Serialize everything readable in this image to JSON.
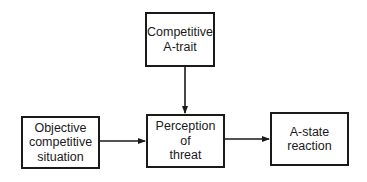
{
  "diagram": {
    "type": "flowchart",
    "nodes": [
      {
        "id": "trait",
        "label": "Competitive\nA-trait"
      },
      {
        "id": "objective",
        "label": "Objective\ncompetitive\nsituation"
      },
      {
        "id": "perception",
        "label": "Perception\nof\nthreat"
      },
      {
        "id": "astate",
        "label": "A-state\nreaction"
      }
    ],
    "edges": [
      {
        "from": "trait",
        "to": "perception"
      },
      {
        "from": "objective",
        "to": "perception"
      },
      {
        "from": "perception",
        "to": "astate"
      }
    ],
    "colors": {
      "stroke": "#1a1a1a",
      "background": "#ffffff"
    }
  }
}
